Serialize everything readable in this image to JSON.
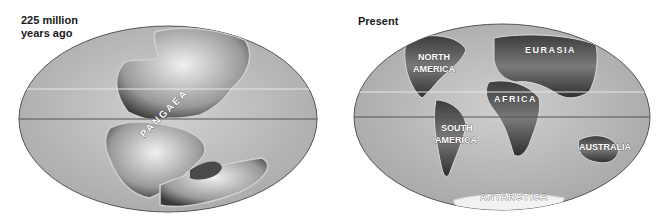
{
  "figure": {
    "left_map": {
      "title_line1": "225 million",
      "title_line2": "years ago",
      "labels": [
        "PANGAEA"
      ]
    },
    "right_map": {
      "title": "Present",
      "labels": {
        "north_america_1": "NORTH",
        "north_america_2": "AMERICA",
        "eurasia": "EURASIA",
        "africa": "AFRICA",
        "south_america_1": "SOUTH",
        "south_america_2": "AMERICA",
        "australia": "AUSTRALIA",
        "antarctica": "ANTARCTICA"
      }
    },
    "colors": {
      "ocean": "#b9b9b9",
      "land_dark": "#3c3c3c",
      "land_light": "#e8e8e8",
      "equator_line": "#555555",
      "tropic_line": "#e6e6e6"
    }
  }
}
